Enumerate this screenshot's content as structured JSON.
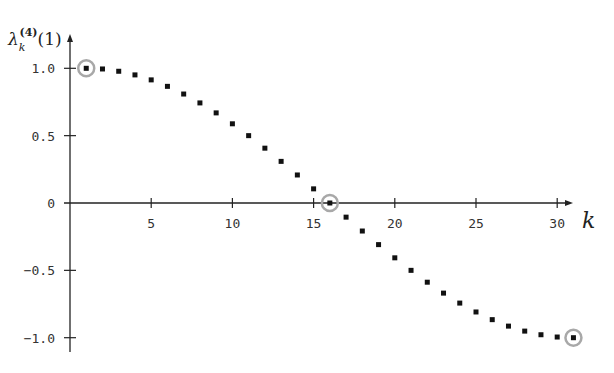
{
  "chart_data": {
    "type": "scatter",
    "title": "",
    "xlabel": "k",
    "ylabel": "λ_k^(4)(1)",
    "ylabel_parts": {
      "base": "λ",
      "sub": "k",
      "sup": "(4)",
      "arg": "(1)"
    },
    "xlim": [
      0,
      32
    ],
    "ylim": [
      -1.1,
      1.1
    ],
    "x_ticks": [
      5,
      10,
      15,
      20,
      25,
      30
    ],
    "x_tick_labels": [
      "5",
      "10",
      "15",
      "20",
      "25",
      "30"
    ],
    "y_ticks": [
      1.0,
      0.5,
      0,
      -0.5,
      -1.0
    ],
    "y_tick_labels": [
      "1.0",
      "0.5",
      "0",
      "−0.5",
      "−1.0"
    ],
    "grid": false,
    "legend": null,
    "series": [
      {
        "name": "eigenvalues",
        "marker": "square",
        "color": "#111111",
        "x": [
          1,
          2,
          3,
          4,
          5,
          6,
          7,
          8,
          9,
          10,
          11,
          12,
          13,
          14,
          15,
          16,
          17,
          18,
          19,
          20,
          21,
          22,
          23,
          24,
          25,
          26,
          27,
          28,
          29,
          30,
          31
        ],
        "y": [
          1.0,
          0.995,
          0.978,
          0.951,
          0.914,
          0.866,
          0.809,
          0.743,
          0.669,
          0.588,
          0.5,
          0.407,
          0.309,
          0.208,
          0.105,
          0.0,
          -0.105,
          -0.208,
          -0.309,
          -0.407,
          -0.5,
          -0.588,
          -0.669,
          -0.743,
          -0.809,
          -0.866,
          -0.914,
          -0.951,
          -0.978,
          -0.995,
          -1.0
        ]
      }
    ],
    "highlighted_points": [
      {
        "x": 1,
        "y": 1.0,
        "style": "gray circle"
      },
      {
        "x": 16,
        "y": 0.0,
        "style": "gray circle"
      },
      {
        "x": 31,
        "y": -1.0,
        "style": "gray circle"
      }
    ],
    "highlight_color": "#a8a8a8",
    "axis_color": "#222222"
  }
}
